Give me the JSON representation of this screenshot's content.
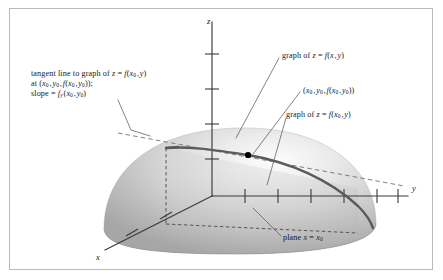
{
  "figure": {
    "kind": "3d-calculus-diagram",
    "background_color": "#ffffff",
    "border_color": "#b9b9b9"
  },
  "axes": {
    "z": {
      "label": "z",
      "tick_count": 4
    },
    "y": {
      "label": "y",
      "tick_count": 6
    },
    "x": {
      "label": "x",
      "tick_count": 2
    }
  },
  "labels": {
    "tangent_line": {
      "line1_prefix": "tangent line to graph of ",
      "line1_expr_z": "z",
      "line1_expr_eq": " = ",
      "line1_expr_f": "f",
      "line1_expr_args": "(x0, y)",
      "line2": "at (x0, y0, f(x0, y0));",
      "line3_prefix": "slope = ",
      "line3_f": "f",
      "line3_sub": "y",
      "line3_args": "(x0, y0)"
    },
    "graph_full": "graph of z = f(x, y)",
    "point": "(x0, y0, f(x0, y0))",
    "graph_slice": "graph of z = f(x0, y)",
    "plane": "plane x = x0"
  },
  "colors": {
    "surface_light": "#f2f2f2",
    "surface_mid": "#c8c8c8",
    "surface_dark": "#9a9a9a",
    "axis": "#3a3a3a",
    "curve": "#555555",
    "dashed": "#4a4a4a",
    "leader": "#5a5a5a",
    "point": "#000000",
    "text": "#1a1a1a"
  },
  "geometry": {
    "origin": {
      "x": 212,
      "y": 196
    },
    "tangent_point": {
      "x": 248,
      "y": 155
    },
    "z_axis_top": {
      "x": 212,
      "y": 22
    },
    "y_axis_right": {
      "x": 408,
      "y": 196
    },
    "x_axis_end": {
      "x": 105,
      "y": 250
    }
  }
}
